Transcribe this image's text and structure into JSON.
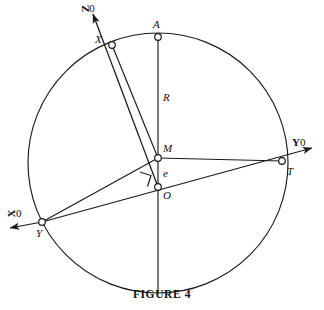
{
  "figure": {
    "caption": "FIGURE 4",
    "type": "geometric-diagram",
    "stroke_color": "#1a1a1a",
    "background_color": "#ffffff"
  },
  "axes": [
    {
      "key": "z0",
      "label_letter": "Z",
      "label_suffix": "0",
      "label": "Z0",
      "position": "top-left",
      "orientation": "rotated",
      "x": 82,
      "y": 3
    },
    {
      "key": "y0",
      "label_letter": "Y",
      "label_suffix": "0",
      "label": "Y0",
      "position": "right",
      "orientation": "upright",
      "x": 292,
      "y": 137
    },
    {
      "key": "x0",
      "label_letter": "X",
      "label_suffix": "0",
      "label": "X0",
      "position": "left",
      "orientation": "rotated",
      "x": 8,
      "y": 208
    }
  ],
  "points": [
    {
      "key": "A",
      "label": "A",
      "cx": 158,
      "cy": 37,
      "label_x": 153,
      "label_y": 19
    },
    {
      "key": "X",
      "label": "X",
      "cx": 112,
      "cy": 45,
      "label_x": 95,
      "label_y": 34
    },
    {
      "key": "Y",
      "label": "Y",
      "cx": 42,
      "cy": 222,
      "label_x": 36,
      "label_y": 228
    },
    {
      "key": "T",
      "label": "T",
      "cx": 282,
      "cy": 161,
      "label_x": 287,
      "label_y": 166
    },
    {
      "key": "M",
      "label": "M",
      "cx": 158,
      "cy": 158,
      "label_x": 163,
      "label_y": 143
    },
    {
      "key": "O",
      "label": "O",
      "cx": 158,
      "cy": 187,
      "label_x": 163,
      "label_y": 190
    }
  ],
  "segment_labels": [
    {
      "key": "R",
      "label": "R",
      "x": 163,
      "y": 92
    },
    {
      "key": "e",
      "label": "e",
      "x": 163,
      "y": 168
    }
  ],
  "circle": {
    "cx": 158,
    "cy": 163,
    "r": 130
  },
  "markers": [
    {
      "key": "right-angle-at-O",
      "label": "right angle",
      "x": 141,
      "y": 173,
      "size": 11
    }
  ]
}
